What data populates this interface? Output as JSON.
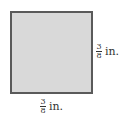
{
  "figure": {
    "shape": "square",
    "fill_color": "#d9d9d9",
    "border_color": "#5a5a5a",
    "side_label_right": {
      "numerator": "3",
      "denominator": "8",
      "unit": "in."
    },
    "side_label_bottom": {
      "numerator": "3",
      "denominator": "8",
      "unit": "in."
    }
  }
}
